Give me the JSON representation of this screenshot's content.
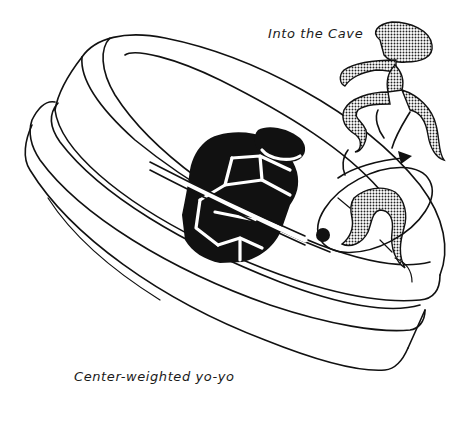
{
  "illustration": {
    "subject": "center-weighted yo-yo with figure entering inner cavity",
    "captions": {
      "top": "Into the Cave",
      "bottom": "Center-weighted yo-yo"
    },
    "icons": {
      "weight": "hexagonal-nut-weight",
      "figure": "dancing-figure-halftone",
      "arrow": "rotation-arrow",
      "axle": "black-dot-axle"
    },
    "colors": {
      "background": "#ffffff",
      "ink": "#111111"
    }
  }
}
